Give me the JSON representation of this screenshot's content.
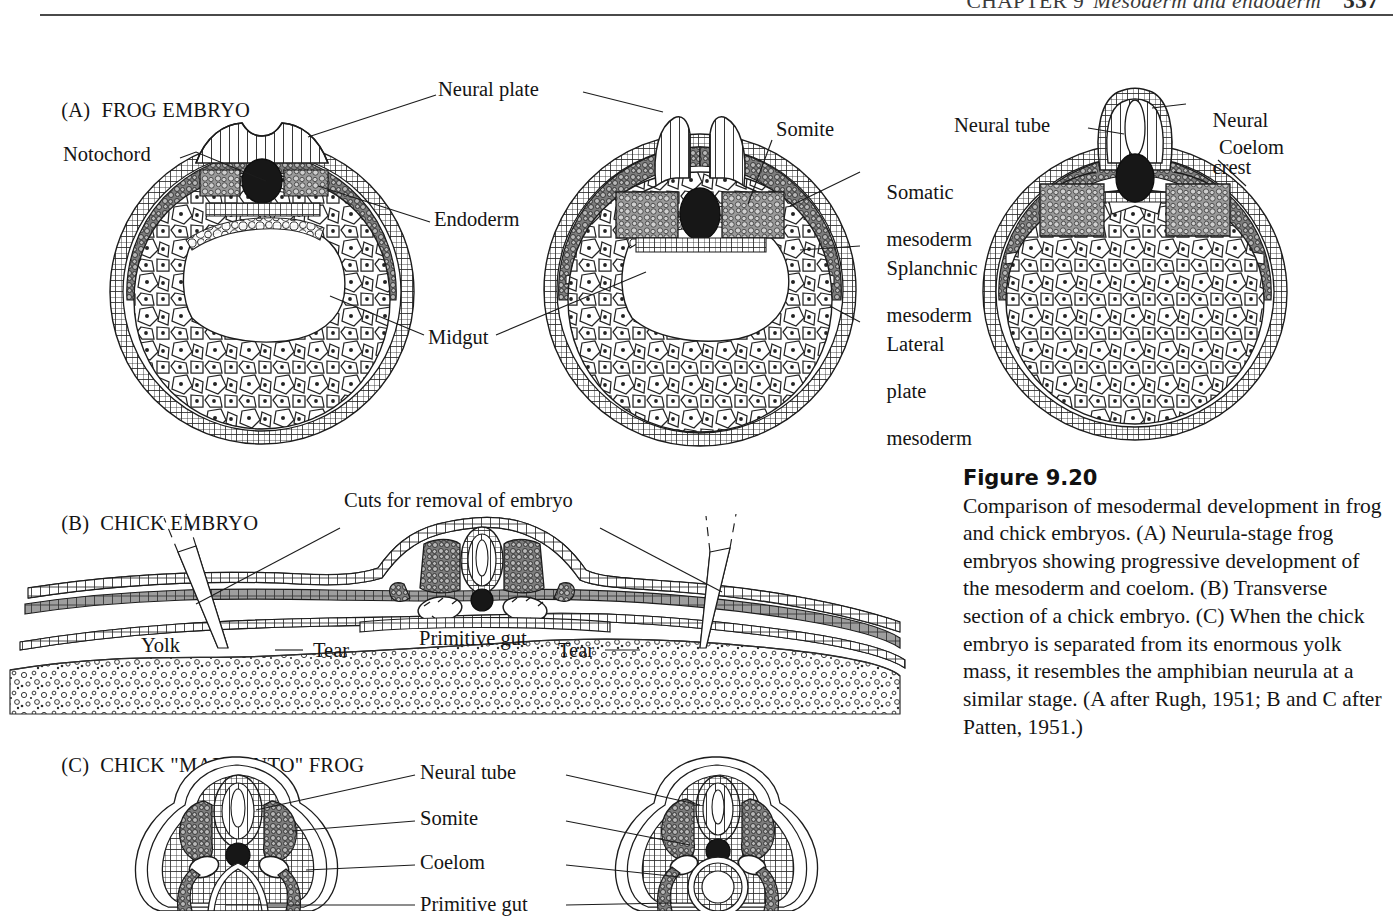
{
  "running_head": {
    "chapter": "CHAPTER 9",
    "title": "Mesoderm and endoderm",
    "page": "337"
  },
  "panels": [
    {
      "id": "A",
      "letter": "(A)",
      "title": "FROG EMBRYO"
    },
    {
      "id": "B",
      "letter": "(B)",
      "title": "CHICK EMBRYO"
    },
    {
      "id": "C",
      "letter": "(C)",
      "title": "CHICK \"MADE INTO\" FROG"
    }
  ],
  "panel_a": {
    "labels": {
      "neural_plate": "Neural plate",
      "notochord": "Notochord",
      "endoderm": "Endoderm",
      "midgut": "Midgut",
      "somite": "Somite",
      "somatic_mesoderm_l1": "Somatic",
      "somatic_mesoderm_l2": "mesoderm",
      "splanchnic_mesoderm_l1": "Splanchnic",
      "splanchnic_mesoderm_l2": "mesoderm",
      "lateral_plate_l1": "Lateral",
      "lateral_plate_l2": "plate",
      "lateral_plate_l3": "mesoderm",
      "neural_tube": "Neural tube",
      "neural_crest_l1": "Neural",
      "neural_crest_l2": "crest",
      "coelom": "Coelom"
    }
  },
  "panel_b": {
    "labels": {
      "cuts": "Cuts for removal of embryo",
      "yolk": "Yolk",
      "tear_left": "Tear",
      "tear_right": "Tear",
      "primitive_gut": "Primitive gut"
    }
  },
  "panel_c": {
    "labels": {
      "neural_tube": "Neural tube",
      "somite": "Somite",
      "coelom": "Coelom",
      "primitive_gut": "Primitive gut"
    }
  },
  "caption": {
    "heading": "Figure 9.20",
    "body": "Comparison of mesodermal development in frog and chick embryos. (A) Neurula-stage frog embryos showing progressive development of the mesoderm and coelom. (B) Transverse section of a chick embryo. (C) When the chick embryo is separated from its enormous yolk mass, it resembles the amphibian neurula at a similar stage. (A after Rugh, 1951; B and C after Patten, 1951.)"
  },
  "colors": {
    "ink": "#1c1c1c",
    "mesoderm_gray": "#8d8d8d",
    "mesoderm_gray_light": "#b3b3b3",
    "notochord_dark": "#1a1a1a",
    "page_background": "#ffffff"
  }
}
